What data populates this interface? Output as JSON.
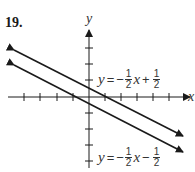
{
  "problem": {
    "number": "19."
  },
  "axes": {
    "x_label": "x",
    "y_label": "y"
  },
  "equations": [
    {
      "y": "y",
      "eq": "=",
      "sign": "−",
      "coef_num": "1",
      "coef_den": "2",
      "var": "x",
      "op": "+",
      "const_num": "1",
      "const_den": "2",
      "text": "y = −1/2 x + 1/2"
    },
    {
      "y": "y",
      "eq": "=",
      "sign": "−",
      "coef_num": "1",
      "coef_den": "2",
      "var": "x",
      "op": "−",
      "const_num": "1",
      "const_den": "2",
      "text": "y = −1/2 x − 1/2"
    }
  ],
  "colors": {
    "ink": "#1a1a1a",
    "background": "#ffffff"
  }
}
